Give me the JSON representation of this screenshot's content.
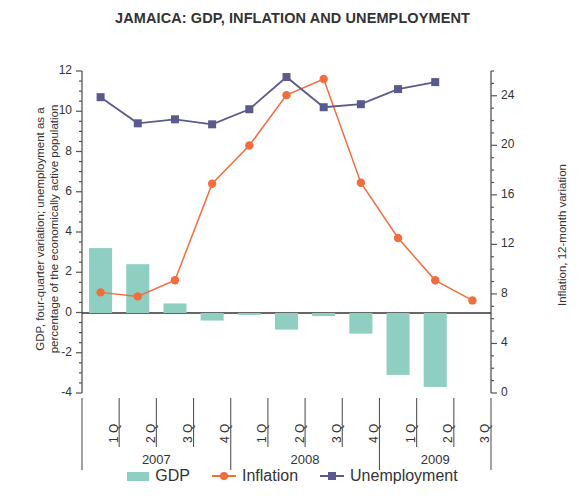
{
  "chart_data": {
    "type": "bar",
    "title": "JAMAICA: GDP, INFLATION AND UNEMPLOYMENT",
    "categories": [
      "1 Q",
      "2 Q",
      "3 Q",
      "4 Q",
      "1 Q",
      "2 Q",
      "3 Q",
      "4 Q",
      "1 Q",
      "2 Q",
      "3 Q"
    ],
    "year_groups": [
      {
        "label": "2007",
        "start": 0,
        "count": 4
      },
      {
        "label": "2008",
        "start": 4,
        "count": 4
      },
      {
        "label": "2009",
        "start": 8,
        "count": 3
      }
    ],
    "xlabel": "",
    "ylabel": "GDP, four-quarter variation; unemployment as a percentage of the economically active population",
    "ylabel_right": "Inflation, 12-month variation",
    "ylim": [
      -4,
      12
    ],
    "yticks": [
      -4,
      -2,
      0,
      2,
      4,
      6,
      8,
      10,
      12
    ],
    "ylim_right": [
      0,
      26
    ],
    "yticks_right": [
      0,
      4,
      8,
      12,
      16,
      20,
      24
    ],
    "grid": false,
    "legend_position": "bottom",
    "series": [
      {
        "name": "GDP",
        "type": "bar",
        "axis": "left",
        "color": "#8ecfc1",
        "values": [
          3.2,
          2.4,
          0.45,
          -0.4,
          -0.12,
          -0.85,
          -0.18,
          -1.05,
          -3.1,
          -3.7,
          null
        ]
      },
      {
        "name": "Inflation",
        "type": "line",
        "axis": "right",
        "color": "#f26d3d",
        "marker": "circle",
        "values_right_axis": [
          7.6,
          7.3,
          9.3,
          16.4,
          19.5,
          24.5,
          25.8,
          16.5,
          11.5,
          8.1,
          6.2
        ],
        "values_left_axis": [
          1.0,
          0.8,
          1.6,
          6.4,
          8.3,
          10.8,
          11.6,
          6.45,
          3.7,
          1.6,
          0.6
        ]
      },
      {
        "name": "Unemployment",
        "type": "line",
        "axis": "left",
        "color": "#5a5a8c",
        "marker": "square",
        "values": [
          10.7,
          9.4,
          9.6,
          9.35,
          10.1,
          11.7,
          10.2,
          10.35,
          11.1,
          11.45,
          null
        ]
      }
    ]
  },
  "legend": {
    "items": [
      {
        "label": "GDP",
        "color": "#8ecfc1",
        "marker": "bar"
      },
      {
        "label": "Inflation",
        "color": "#f26d3d",
        "marker": "circle"
      },
      {
        "label": "Unemployment",
        "color": "#5a5a8c",
        "marker": "square"
      }
    ]
  }
}
